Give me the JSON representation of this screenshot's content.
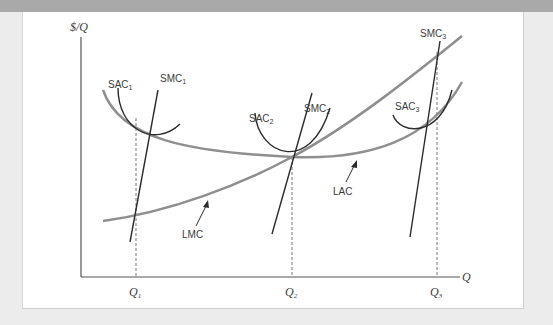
{
  "figure": {
    "y_axis_label": "$/Q",
    "x_axis_label": "Q",
    "quantity_ticks": [
      {
        "base": "Q",
        "sub": "1"
      },
      {
        "base": "Q",
        "sub": "2"
      },
      {
        "base": "Q",
        "sub": "3"
      }
    ],
    "curves": {
      "sac1": {
        "base": "SAC",
        "sub": "1"
      },
      "smc1": {
        "base": "SMC",
        "sub": "1"
      },
      "sac2": {
        "base": "SAC",
        "sub": "2"
      },
      "smc2": {
        "base": "SMC",
        "sub": "2"
      },
      "sac3": {
        "base": "SAC",
        "sub": "3"
      },
      "smc3": {
        "base": "SMC",
        "sub": "3"
      },
      "lac": "LAC",
      "lmc": "LMC"
    },
    "colors": {
      "long_run_curves": "#8f8f8f",
      "short_run_curves": "#2b2b2b",
      "axes": "#555555",
      "frame_band": "#a9a9a9"
    }
  }
}
